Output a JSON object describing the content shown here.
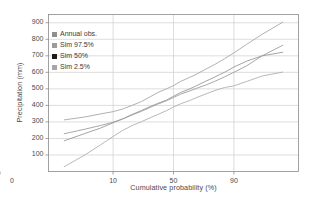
{
  "chart_data": {
    "type": "line",
    "title": "",
    "xlabel": "Cumulative probability (%)",
    "ylabel": "Precipitation (mm)",
    "xlim": [
      0.4,
      99.6
    ],
    "ylim": [
      0,
      950
    ],
    "x_scale": "probability",
    "grid": true,
    "legend_position": "top-left-inside",
    "x_ticks": [
      0,
      10,
      50,
      90
    ],
    "x_tick_labels": [
      "0",
      "10",
      "50",
      "90"
    ],
    "y_ticks": [
      100,
      200,
      300,
      400,
      500,
      600,
      700,
      800,
      900
    ],
    "y_tick_labels": [
      "100",
      "200",
      "300",
      "400",
      "500",
      "600",
      "700",
      "800",
      "900"
    ],
    "series": [
      {
        "name": "Annual obs.",
        "color": "#9a9a9a",
        "x": [
          1,
          3,
          6,
          10,
          14,
          19,
          25,
          31,
          37,
          44,
          50,
          56,
          63,
          69,
          75,
          81,
          86,
          90,
          94,
          97,
          99
        ],
        "y": [
          185,
          230,
          262,
          295,
          318,
          345,
          370,
          393,
          412,
          432,
          455,
          478,
          498,
          520,
          545,
          572,
          600,
          632,
          668,
          700,
          722
        ]
      },
      {
        "name": "Sim 97.5%",
        "color": "#a8a8a8",
        "x": [
          1,
          3,
          6,
          10,
          14,
          19,
          25,
          31,
          37,
          44,
          50,
          56,
          63,
          69,
          75,
          81,
          86,
          90,
          94,
          97,
          99
        ],
        "y": [
          312,
          330,
          348,
          362,
          378,
          400,
          424,
          452,
          478,
          500,
          520,
          545,
          568,
          590,
          618,
          648,
          682,
          718,
          770,
          830,
          905
        ]
      },
      {
        "name": "Sim 50%",
        "color": "#9e9e9e",
        "x": [
          1,
          3,
          6,
          10,
          14,
          19,
          25,
          31,
          37,
          44,
          50,
          56,
          63,
          69,
          75,
          81,
          86,
          90,
          94,
          97,
          99
        ],
        "y": [
          228,
          256,
          278,
          298,
          318,
          342,
          365,
          388,
          408,
          428,
          448,
          468,
          486,
          504,
          522,
          546,
          572,
          600,
          640,
          700,
          765
        ]
      },
      {
        "name": "Sim 2.5%",
        "color": "#b0b0b0",
        "x": [
          1,
          3,
          6,
          10,
          14,
          19,
          25,
          31,
          37,
          44,
          50,
          56,
          63,
          69,
          75,
          81,
          86,
          90,
          94,
          97,
          99
        ],
        "y": [
          28,
          100,
          160,
          212,
          248,
          278,
          302,
          325,
          345,
          368,
          390,
          410,
          428,
          448,
          468,
          490,
          508,
          518,
          545,
          578,
          602
        ]
      }
    ]
  },
  "legend": {
    "items": [
      {
        "label": "Annual obs.",
        "color": "#8e8e8e"
      },
      {
        "label": "Sim 97.5%",
        "color": "#9c9c9c"
      },
      {
        "label": "Sim 50%",
        "color": "#1c1c1c"
      },
      {
        "label": "Sim 2.5%",
        "color": "#a6a6a6"
      }
    ]
  },
  "style": {
    "axis_color": "#8a8a8a",
    "grid_color": "#cfcfcf",
    "background": "#ffffff",
    "text_color": "#3a3a3a"
  }
}
